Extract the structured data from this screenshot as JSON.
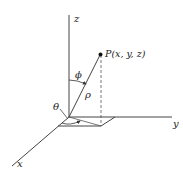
{
  "diagram": {
    "axes": {
      "x_label": "x",
      "y_label": "y",
      "z_label": "z"
    },
    "point": {
      "label": "P(x, y, z)"
    },
    "angles": {
      "phi": "ϕ",
      "theta": "θ"
    },
    "radius": {
      "label": "ρ"
    },
    "colors": {
      "line": "#333333",
      "background": "#ffffff"
    }
  }
}
